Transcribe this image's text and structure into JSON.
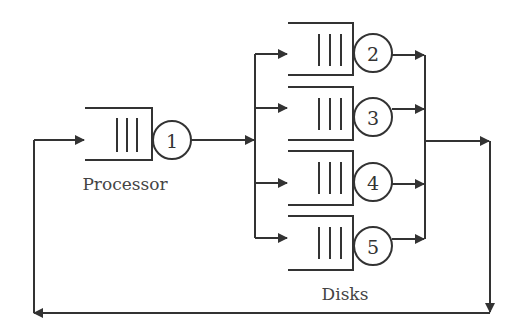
{
  "diagram": {
    "type": "closed queueing network",
    "colors": {
      "stroke": "#333333",
      "background": "#ffffff"
    },
    "processor": {
      "label": "Processor",
      "server_number": "1"
    },
    "disks": {
      "label": "Disks",
      "servers": [
        {
          "number": "2"
        },
        {
          "number": "3"
        },
        {
          "number": "4"
        },
        {
          "number": "5"
        }
      ]
    }
  }
}
